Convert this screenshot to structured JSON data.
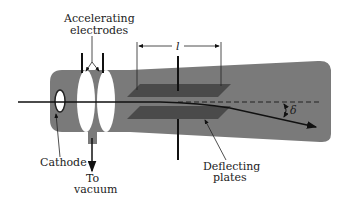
{
  "diagram": {
    "labels": {
      "accelerating_line1": "Accelerating",
      "accelerating_line2": "electrodes",
      "plate_length": "l",
      "deflection_angle": "δ",
      "cathode": "Cathode",
      "to_vacuum_line1": "To",
      "to_vacuum_line2": "vacuum",
      "deflecting_line1": "Deflecting",
      "deflecting_line2": "plates"
    },
    "colors": {
      "tube": "#7a7a7a",
      "plates": "#4a4a4a",
      "electrodes": "#ffffff",
      "lines": "#111111"
    }
  }
}
